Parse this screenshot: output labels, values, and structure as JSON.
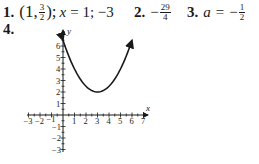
{
  "answers": [
    {
      "number": "1.",
      "point_open": "(1,",
      "point_num": "3",
      "point_den": "2",
      "point_close": ");",
      "axis_text": "x",
      "axis_eq": "= 1; −3"
    },
    {
      "number": "2.",
      "sign": "−",
      "num": "29",
      "den": "4"
    },
    {
      "number": "3.",
      "var": "a",
      "eq": "=",
      "sign": "−",
      "num": "1",
      "den": "2"
    },
    {
      "number": "4."
    }
  ],
  "chart_data": {
    "type": "line",
    "title": "",
    "xlabel": "x",
    "ylabel": "y",
    "xlim": [
      -3,
      7
    ],
    "ylim": [
      -3,
      7
    ],
    "x_ticks": [
      "-3",
      "-2",
      "-1",
      "1",
      "2",
      "3",
      "4",
      "5",
      "6",
      "7"
    ],
    "y_ticks": [
      "-3",
      "-2",
      "-1",
      "1",
      "2",
      "3",
      "4",
      "5",
      "6"
    ],
    "function": "f(x) = 0.5(x-3)^2 + 2",
    "vertex": [
      3,
      2
    ],
    "x": [
      0,
      0.5,
      1,
      1.5,
      2,
      2.5,
      3,
      3.5,
      4,
      4.5,
      5,
      5.5,
      6
    ],
    "y": [
      6.5,
      5.125,
      4,
      3.125,
      2.5,
      2.125,
      2,
      2.125,
      2.5,
      3.125,
      4,
      5.125,
      6.5
    ],
    "grid": false,
    "arrows_at_ends": true,
    "color": "#1a1a1a"
  }
}
